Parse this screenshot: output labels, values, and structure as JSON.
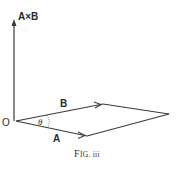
{
  "figure": {
    "caption": "Fig. iii",
    "caption_prefix": "F",
    "caption_rest": "IG. iii",
    "labels": {
      "cross_product": "A×B",
      "origin": "O",
      "vector_a": "A",
      "vector_b": "B",
      "angle": "θ"
    },
    "colors": {
      "line": "#3a3a3a",
      "text": "#2a2a2a"
    }
  }
}
